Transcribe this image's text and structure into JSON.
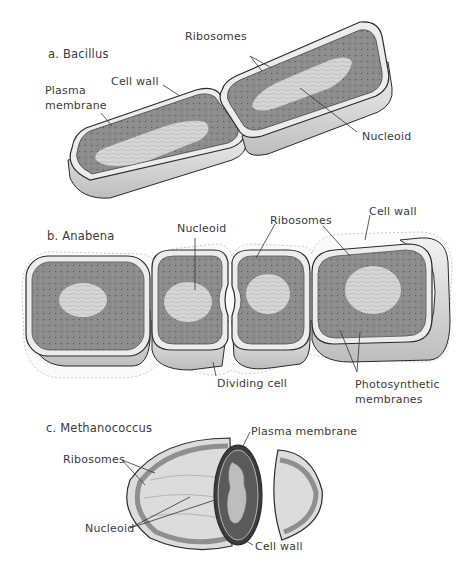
{
  "figure": {
    "panels": [
      {
        "id": "a",
        "title": "a.  Bacillus",
        "labels": {
          "ribosomes": "Ribosomes",
          "cell_wall": "Cell wall",
          "plasma_membrane_1": "Plasma",
          "plasma_membrane_2": "membrane",
          "nucleoid": "Nucleoid"
        }
      },
      {
        "id": "b",
        "title": "b.  Anabena",
        "labels": {
          "nucleoid": "Nucleoid",
          "ribosomes": "Ribosomes",
          "cell_wall": "Cell wall",
          "dividing_cell": "Dividing cell",
          "photosynthetic_1": "Photosynthetic",
          "photosynthetic_2": "membranes"
        }
      },
      {
        "id": "c",
        "title": "c. Methanococcus",
        "labels": {
          "plasma_membrane": "Plasma membrane",
          "ribosomes": "Ribosomes",
          "nucleoid": "Nucleoid",
          "cell_wall": "Cell wall"
        }
      }
    ],
    "colors": {
      "cytoplasm": "#8a8a8a",
      "nucleoid": "#d4d4d4",
      "wall": "#e6e6e6",
      "outline": "#2a2a2a",
      "text": "#3a3a3a"
    }
  }
}
